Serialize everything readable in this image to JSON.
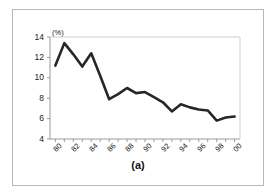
{
  "figure": {
    "caption": "(a)",
    "unit_label": "(%)",
    "border_color": "#b8b8b8",
    "background": "#ffffff"
  },
  "chart_data": {
    "type": "line",
    "title": "",
    "subtitle": "",
    "xlabel": "",
    "ylabel": "(%)",
    "x": [
      "80",
      "81",
      "82",
      "83",
      "84",
      "85",
      "86",
      "87",
      "88",
      "89",
      "90",
      "91",
      "92",
      "93",
      "94",
      "95",
      "96",
      "97",
      "98",
      "99",
      "00"
    ],
    "values": [
      11.2,
      13.4,
      12.3,
      11.1,
      12.4,
      10.2,
      7.9,
      8.4,
      9.0,
      8.5,
      8.6,
      8.1,
      7.6,
      6.7,
      7.4,
      7.1,
      6.9,
      6.8,
      5.8,
      6.1,
      6.2
    ],
    "series": [
      {
        "name": "rate",
        "color": "#262626",
        "line_width": 2.6,
        "values": [
          11.2,
          13.4,
          12.3,
          11.1,
          12.4,
          10.2,
          7.9,
          8.4,
          9.0,
          8.5,
          8.6,
          8.1,
          7.6,
          6.7,
          7.4,
          7.1,
          6.9,
          6.8,
          5.8,
          6.1,
          6.2
        ]
      }
    ],
    "xtick_labels": [
      "80",
      "82",
      "84",
      "86",
      "88",
      "90",
      "92",
      "94",
      "96",
      "98",
      "00"
    ],
    "xtick_values": [
      80,
      82,
      84,
      86,
      88,
      90,
      92,
      94,
      96,
      98,
      100
    ],
    "ytick_labels": [
      "4",
      "6",
      "8",
      "10",
      "12",
      "14"
    ],
    "ytick_values": [
      4,
      6,
      8,
      10,
      12,
      14
    ],
    "xlim": [
      79.4,
      100.6
    ],
    "ylim": [
      4,
      14
    ],
    "grid": false,
    "legend": "none",
    "axis_color": "#9a9a9a",
    "plot_border": true
  }
}
